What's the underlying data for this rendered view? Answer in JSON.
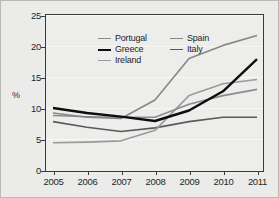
{
  "chart_data": {
    "type": "line",
    "title": "",
    "subtitle": "",
    "xlabel": "",
    "ylabel": "%",
    "x": [
      2005,
      2006,
      2007,
      2008,
      2009,
      2010,
      2011
    ],
    "xtick_labels": [
      "2005",
      "2006",
      "2007",
      "2008",
      "2009",
      "2010",
      "2011"
    ],
    "ytick_labels": [
      "0",
      "5",
      "10",
      "15",
      "20",
      "25"
    ],
    "ytick_values": [
      0,
      5,
      10,
      15,
      20,
      25
    ],
    "ylim": [
      0,
      25
    ],
    "xlim": [
      2005,
      2011
    ],
    "grid": true,
    "grid_axis": "y",
    "legend_position": "top-left-inside",
    "legend_columns": 2,
    "series": [
      {
        "name": "Portugal",
        "color": "#8c8c8c",
        "width": 1.6,
        "values": [
          8.8,
          8.6,
          8.5,
          8.5,
          10.6,
          12.0,
          13.0
        ]
      },
      {
        "name": "Greece",
        "color": "#0d0d0d",
        "width": 2.4,
        "values": [
          10.0,
          9.2,
          8.6,
          7.9,
          9.6,
          12.7,
          17.9
        ]
      },
      {
        "name": "Ireland",
        "color": "#9a9a9a",
        "width": 1.6,
        "values": [
          4.4,
          4.5,
          4.7,
          6.4,
          12.0,
          13.9,
          14.6
        ]
      },
      {
        "name": "Spain",
        "color": "#878787",
        "width": 1.6,
        "values": [
          9.2,
          8.5,
          8.3,
          11.3,
          18.0,
          20.1,
          21.7
        ]
      },
      {
        "name": "Italy",
        "color": "#5a5a5a",
        "width": 1.6,
        "values": [
          7.8,
          6.9,
          6.2,
          6.8,
          7.8,
          8.5,
          8.5
        ]
      }
    ]
  },
  "legend": {
    "column_1": [
      "Portugal",
      "Greece",
      "Ireland"
    ],
    "column_2": [
      "Spain",
      "Italy"
    ]
  },
  "colors": {
    "background": "#ebebea",
    "plot_background": "#ededec",
    "frame": "#3a3a3a",
    "gridline": "#f7f7f6",
    "text": "#262626"
  }
}
